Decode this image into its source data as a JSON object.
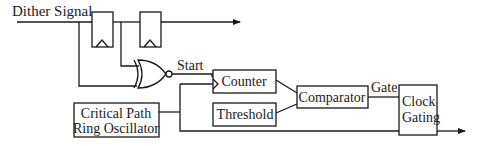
{
  "diagram": {
    "type": "block-diagram",
    "input_label": "Dither Signal",
    "start_label": "Start",
    "gate_label": "Gate",
    "blocks": {
      "counter": "Counter",
      "threshold": "Threshold",
      "comparator": "Comparator",
      "oscillator_line1": "Critical Path",
      "oscillator_line2": "Ring Oscillator",
      "clock_gating_line1": "Clock",
      "clock_gating_line2": "Gating"
    },
    "components": [
      "flip-flop-1",
      "flip-flop-2",
      "xnor-gate",
      "counter",
      "threshold",
      "comparator",
      "ring-oscillator",
      "clock-gating"
    ],
    "colors": {
      "line": "#1a1a1a",
      "background": "#ffffff"
    }
  }
}
